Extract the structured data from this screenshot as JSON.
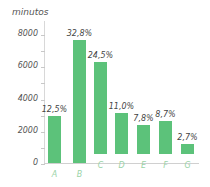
{
  "chart_data": {
    "type": "bar",
    "title": "",
    "xlabel": "",
    "ylabel": "minutos",
    "ylim": [
      0,
      8000
    ],
    "yticks": [
      0,
      2000,
      4000,
      6000,
      8000
    ],
    "ytick_labels": [
      "0",
      "2000",
      "4000",
      "6000",
      "8000"
    ],
    "categories": [
      "A",
      "B",
      "C",
      "D",
      "E",
      "F",
      "G"
    ],
    "values": [
      2900,
      7600,
      5680,
      2550,
      1810,
      2020,
      630
    ],
    "percent_labels": [
      "12,5%",
      "32,8%",
      "24,5%",
      "11,0%",
      "7,8%",
      "8,7%",
      "2,7%"
    ],
    "grid": false,
    "legend": null,
    "bar_color": "#5cc27a"
  }
}
